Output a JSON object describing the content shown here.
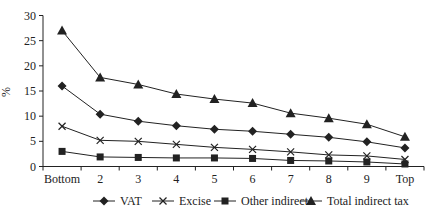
{
  "chart_data": {
    "type": "line",
    "title": "",
    "xlabel": "",
    "ylabel": "%",
    "ylim": [
      0,
      30
    ],
    "yticks": [
      0,
      5,
      10,
      15,
      20,
      25,
      30
    ],
    "grid": false,
    "legend_position": "bottom",
    "categories": [
      "Bottom",
      "2",
      "3",
      "4",
      "5",
      "6",
      "7",
      "8",
      "9",
      "Top"
    ],
    "series": [
      {
        "name": "VAT",
        "marker": "diamond",
        "values": [
          16.0,
          10.4,
          9.0,
          8.1,
          7.4,
          7.0,
          6.4,
          5.8,
          4.9,
          3.7
        ]
      },
      {
        "name": "Excise",
        "marker": "x",
        "values": [
          8.0,
          5.2,
          5.0,
          4.4,
          3.8,
          3.4,
          2.9,
          2.3,
          2.1,
          1.4
        ]
      },
      {
        "name": "Other indirect",
        "marker": "square",
        "values": [
          3.0,
          1.9,
          1.8,
          1.7,
          1.7,
          1.6,
          1.2,
          1.1,
          0.9,
          0.5
        ]
      },
      {
        "name": "Total indirect tax",
        "marker": "triangle",
        "values": [
          27.0,
          17.7,
          16.3,
          14.4,
          13.4,
          12.6,
          10.6,
          9.6,
          8.4,
          5.9
        ]
      }
    ]
  },
  "colors": {
    "ink": "#222222",
    "background": "#ffffff"
  }
}
